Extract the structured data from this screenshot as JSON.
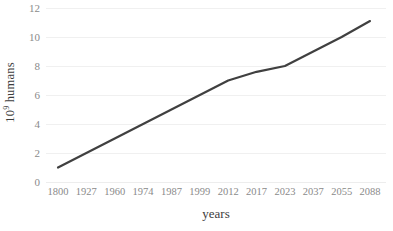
{
  "chart_data": {
    "type": "line",
    "title": "",
    "xlabel": "years",
    "ylabel": "10⁹ humans",
    "ylabel_base": "10",
    "ylabel_exponent": "9",
    "ylabel_suffix": " humans",
    "categories": [
      "1800",
      "1927",
      "1960",
      "1974",
      "1987",
      "1999",
      "2012",
      "2017",
      "2023",
      "2037",
      "2055",
      "2088"
    ],
    "values": [
      1.0,
      2.0,
      3.0,
      4.0,
      5.0,
      6.0,
      7.0,
      7.6,
      8.0,
      9.0,
      10.0,
      11.1
    ],
    "series": [
      {
        "name": "world population",
        "values": [
          1.0,
          2.0,
          3.0,
          4.0,
          5.0,
          6.0,
          7.0,
          7.6,
          8.0,
          9.0,
          10.0,
          11.1
        ],
        "color": "#404040"
      }
    ],
    "ylim": [
      0,
      12
    ],
    "yticks": [
      0,
      2,
      4,
      6,
      8,
      10,
      12
    ],
    "ytick_labels": [
      "0",
      "2",
      "4",
      "6",
      "8",
      "10",
      "12"
    ],
    "grid": "horizontal",
    "grid_color": "#f0f0f0",
    "legend": "none",
    "line_color": "#404040",
    "line_width": 2.2,
    "background": "#ffffff",
    "tick_label_color": "#8a8a8a",
    "axis_title_color": "#3d3d3d"
  }
}
